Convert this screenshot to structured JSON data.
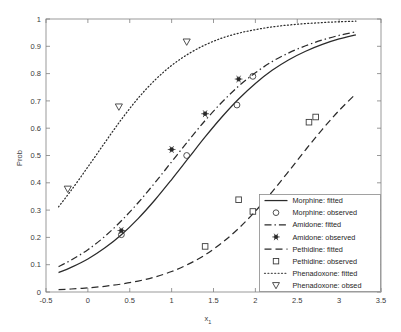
{
  "chart_data": {
    "type": "line",
    "title": "",
    "xlabel": "x_1",
    "xlabel_base": "x",
    "xlabel_sub": "1",
    "ylabel": "Prob",
    "xlim": [
      -0.5,
      3.5
    ],
    "ylim": [
      0,
      1
    ],
    "xticks": [
      "-0.5",
      "0",
      "0.5",
      "1",
      "1.5",
      "2",
      "2.5",
      "3",
      "3.5"
    ],
    "xtick_values": [
      -0.5,
      0,
      0.5,
      1,
      1.5,
      2,
      2.5,
      3,
      3.5
    ],
    "yticks": [
      "0",
      "0.1",
      "0.2",
      "0.3",
      "0.4",
      "0.5",
      "0.6",
      "0.7",
      "0.8",
      "0.9",
      "1"
    ],
    "ytick_values": [
      0,
      0.1,
      0.2,
      0.3,
      0.4,
      0.5,
      0.6,
      0.7,
      0.8,
      0.9,
      1.0
    ],
    "grid": false,
    "legend_position": "lower-right",
    "series": [
      {
        "name": "Morphine: fitted",
        "kind": "fitted",
        "style": "solid",
        "color": "#2b2b2b",
        "x": [
          -0.35,
          -0.2,
          0,
          0.2,
          0.4,
          0.6,
          0.8,
          1.0,
          1.2,
          1.4,
          1.6,
          1.8,
          2.0,
          2.2,
          2.4,
          2.6,
          2.8,
          3.0,
          3.2
        ],
        "y": [
          0.071,
          0.09,
          0.121,
          0.161,
          0.21,
          0.269,
          0.337,
          0.412,
          0.49,
          0.568,
          0.641,
          0.707,
          0.764,
          0.812,
          0.851,
          0.882,
          0.907,
          0.927,
          0.942
        ]
      },
      {
        "name": "Morphine: observed",
        "kind": "observed",
        "marker": "circle",
        "color": "#3c3c3c",
        "x": [
          0.4,
          1.18,
          1.78,
          1.97
        ],
        "y": [
          0.21,
          0.5,
          0.685,
          0.79
        ]
      },
      {
        "name": "Amidone: fitted",
        "kind": "fitted",
        "style": "dashdot",
        "color": "#2b2b2b",
        "x": [
          -0.35,
          -0.2,
          0,
          0.2,
          0.4,
          0.6,
          0.8,
          1.0,
          1.2,
          1.4,
          1.6,
          1.8,
          2.0,
          2.2,
          2.4,
          2.6,
          2.8,
          3.0,
          3.2
        ],
        "y": [
          0.093,
          0.117,
          0.155,
          0.203,
          0.261,
          0.327,
          0.4,
          0.477,
          0.554,
          0.628,
          0.695,
          0.754,
          0.803,
          0.844,
          0.876,
          0.902,
          0.923,
          0.94,
          0.953
        ]
      },
      {
        "name": "Amidone: observed",
        "kind": "observed",
        "marker": "star-dot",
        "color": "#2a2a2a",
        "x": [
          0.4,
          1.0,
          1.4,
          1.8
        ],
        "y": [
          0.225,
          0.522,
          0.653,
          0.78
        ]
      },
      {
        "name": "Pethidine: fitted",
        "kind": "fitted",
        "style": "dashed",
        "color": "#2b2b2b",
        "x": [
          -0.35,
          -0.2,
          0,
          0.2,
          0.4,
          0.6,
          0.8,
          1.0,
          1.2,
          1.4,
          1.6,
          1.8,
          2.0,
          2.2,
          2.4,
          2.6,
          2.8,
          3.0,
          3.2
        ],
        "y": [
          0.009,
          0.011,
          0.015,
          0.021,
          0.029,
          0.04,
          0.055,
          0.075,
          0.102,
          0.136,
          0.18,
          0.233,
          0.296,
          0.367,
          0.443,
          0.521,
          0.596,
          0.665,
          0.726
        ]
      },
      {
        "name": "Pethidine: observed",
        "kind": "observed",
        "marker": "square",
        "color": "#3c3c3c",
        "x": [
          1.4,
          1.8,
          1.97,
          2.64,
          2.72
        ],
        "y": [
          0.167,
          0.338,
          0.295,
          0.622,
          0.641
        ]
      },
      {
        "name": "Phenadoxone: fitted",
        "kind": "fitted",
        "style": "dotted",
        "color": "#555555",
        "x": [
          -0.35,
          -0.2,
          0,
          0.2,
          0.4,
          0.6,
          0.8,
          1.0,
          1.2,
          1.4,
          1.6,
          1.8,
          2.0,
          2.2,
          2.4,
          2.6,
          2.8,
          3.0,
          3.2
        ],
        "y": [
          0.312,
          0.372,
          0.458,
          0.546,
          0.632,
          0.71,
          0.776,
          0.83,
          0.872,
          0.905,
          0.93,
          0.948,
          0.961,
          0.971,
          0.978,
          0.983,
          0.987,
          0.99,
          0.992
        ]
      },
      {
        "name": "Phenadoxone: obsed",
        "kind": "observed",
        "marker": "triangle-down",
        "color": "#4a4a4a",
        "x": [
          -0.24,
          0.37,
          1.18
        ],
        "y": [
          0.377,
          0.678,
          0.916
        ]
      }
    ]
  },
  "legend": {
    "entries": [
      {
        "label": "Morphine: fitted",
        "type": "line",
        "style": "solid"
      },
      {
        "label": "Morphine: observed",
        "type": "marker",
        "marker": "circle"
      },
      {
        "label": "Amidone: fitted",
        "type": "line",
        "style": "dashdot"
      },
      {
        "label": "Amidone: observed",
        "type": "marker",
        "marker": "star-dot"
      },
      {
        "label": "Pethidine: fitted",
        "type": "line",
        "style": "dashed"
      },
      {
        "label": "Pethidine: observed",
        "type": "marker",
        "marker": "square"
      },
      {
        "label": "Phenadoxone: fitted",
        "type": "line",
        "style": "dotted"
      },
      {
        "label": "Phenadoxone: obsed",
        "type": "marker",
        "marker": "triangle-down"
      }
    ]
  },
  "colors": {
    "axis": "#808080",
    "text": "#3a3a3a",
    "curve": "#2b2b2b",
    "background": "#ffffff"
  }
}
